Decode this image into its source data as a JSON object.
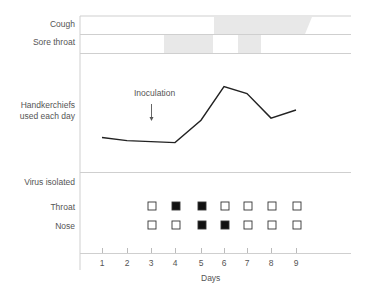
{
  "chart_data": {
    "type": "line",
    "title": "",
    "xlabel": "Days",
    "x": [
      1,
      2,
      3,
      4,
      5,
      6,
      7,
      8,
      9
    ],
    "tick_labels": [
      "1",
      "2",
      "3",
      "4",
      "5",
      "6",
      "7",
      "8",
      "9"
    ],
    "rows": {
      "cough": {
        "label": "Cough",
        "shaded_intervals_days": [
          [
            5.5,
            8.4
          ]
        ],
        "note": "shaded band tapers off near day 8.4"
      },
      "sore_throat": {
        "label": "Sore throat",
        "shaded_intervals_days": [
          [
            3.5,
            5.5
          ],
          [
            6.5,
            7.5
          ]
        ]
      },
      "handkerchiefs": {
        "label_line1": "Handkerchiefs",
        "label_line2": "used each day",
        "series": [
          {
            "name": "Handkerchiefs used each day",
            "x": [
              1,
              2,
              4,
              5,
              6,
              7,
              8,
              9
            ],
            "values": [
              2.5,
              2.2,
              2.0,
              4.2,
              7.5,
              6.8,
              4.4,
              5.2
            ]
          }
        ],
        "annotation": {
          "text": "Inoculation",
          "day": 3
        },
        "ylim": [
          0,
          10
        ],
        "y_units": "relative (no axis ticks shown)"
      },
      "virus_isolated": {
        "label": "Virus isolated",
        "throat": {
          "label": "Throat",
          "days": [
            3,
            4,
            5,
            6,
            7,
            8,
            9
          ],
          "positive": [
            false,
            true,
            true,
            false,
            false,
            false,
            false
          ]
        },
        "nose": {
          "label": "Nose",
          "days": [
            3,
            4,
            5,
            6,
            7,
            8,
            9
          ],
          "positive": [
            false,
            false,
            true,
            true,
            false,
            false,
            false
          ]
        }
      }
    },
    "grid": false,
    "legend": "none"
  },
  "labels": {
    "cough": "Cough",
    "sore_throat": "Sore throat",
    "hk1": "Handkerchiefs",
    "hk2": "used each day",
    "inoculation": "Inoculation",
    "virus": "Virus isolated",
    "throat": "Throat",
    "nose": "Nose",
    "xlabel": "Days",
    "ticks": [
      "1",
      "2",
      "3",
      "4",
      "5",
      "6",
      "7",
      "8",
      "9"
    ]
  },
  "colors": {
    "line": "#222222",
    "rule": "#cccccc",
    "shade": "#e6e6e6",
    "marker_fill": "#111111"
  }
}
